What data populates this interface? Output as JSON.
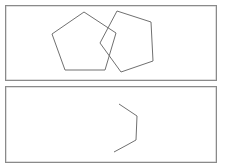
{
  "panels": [
    {
      "name": "top-panel",
      "box": {
        "x": 5,
        "y": 5,
        "w": 211,
        "h": 75
      },
      "shapes": [
        {
          "name": "pentagon-left",
          "type": "polygon",
          "points": "84,12 116,33 105,70 65,70 52,34"
        },
        {
          "name": "pentagon-right",
          "type": "polygon",
          "points": "117,11 151,22 153,61 121,72 100,43"
        }
      ]
    },
    {
      "name": "bottom-panel",
      "box": {
        "x": 5,
        "y": 86,
        "w": 211,
        "h": 76
      },
      "shapes": [
        {
          "name": "partial-pentagon-stroke",
          "type": "polyline",
          "points": "119,104 137,116 136,140 127,145 114,152"
        }
      ]
    }
  ],
  "colors": {
    "stroke": "#707070",
    "border": "#8a8a8a",
    "background": "#ffffff"
  }
}
